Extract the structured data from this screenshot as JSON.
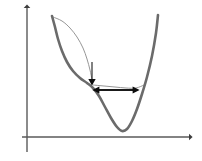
{
  "figure": {
    "background_color": "#ffffff",
    "width": 202,
    "height": 161
  },
  "axes": {
    "x_axis": {
      "label": "",
      "name": "x-axis",
      "color": "#5a5a5a",
      "stroke_width": 1.4,
      "x_start": 22,
      "x_end": 191,
      "y": 137,
      "arrow_at": "right"
    },
    "y_axis": {
      "label": "",
      "name": "y-axis",
      "color": "#5a5a5a",
      "stroke_width": 1.4,
      "x": 27,
      "y_start": 152,
      "y_end": 6,
      "arrow_at": "top"
    }
  },
  "chart_data": {
    "type": "line",
    "title": "",
    "xlabel": "",
    "ylabel": "",
    "grid": false,
    "legend": "none",
    "series": [
      {
        "name": "main-potential-curve",
        "style": "thick",
        "color": "#6b6b6b",
        "stroke_width": 2.6,
        "points": [
          [
            52,
            16
          ],
          [
            55,
            27
          ],
          [
            58,
            39
          ],
          [
            62,
            51
          ],
          [
            67,
            62
          ],
          [
            73,
            71
          ],
          [
            80,
            78
          ],
          [
            87,
            83
          ],
          [
            93,
            88
          ],
          [
            99,
            96
          ],
          [
            105,
            107
          ],
          [
            111,
            118
          ],
          [
            117,
            127
          ],
          [
            122,
            131
          ],
          [
            127,
            129
          ],
          [
            132,
            121
          ],
          [
            137,
            109
          ],
          [
            142,
            94
          ],
          [
            147,
            77
          ],
          [
            152,
            56
          ],
          [
            156,
            33
          ],
          [
            158,
            15
          ]
        ]
      },
      {
        "name": "thin-arc-curve",
        "style": "thin",
        "color": "#8a8a8a",
        "stroke_width": 0.9,
        "points": [
          [
            53,
            17
          ],
          [
            62,
            21
          ],
          [
            70,
            28
          ],
          [
            77,
            37
          ],
          [
            83,
            48
          ],
          [
            87,
            59
          ],
          [
            90,
            70
          ],
          [
            92,
            80
          ],
          [
            92,
            84
          ]
        ]
      },
      {
        "name": "thin-shoulder-arc",
        "style": "thin",
        "color": "#8a8a8a",
        "stroke_width": 0.9,
        "points": [
          [
            93,
            85
          ],
          [
            104,
            86
          ],
          [
            115,
            87
          ],
          [
            126,
            88
          ],
          [
            136,
            88
          ],
          [
            144,
            85
          ]
        ]
      }
    ],
    "annotations": [
      {
        "name": "downward-arrow",
        "type": "arrow",
        "direction": "down",
        "color": "#1a1a1a",
        "stroke_width": 1.1,
        "from": [
          92,
          62
        ],
        "to": [
          92,
          84
        ],
        "head_size": 4.2
      },
      {
        "name": "barrier-width-arrow",
        "type": "double-arrow",
        "direction": "horizontal",
        "color": "#1a1a1a",
        "stroke_width": 2.2,
        "from": [
          95,
          90
        ],
        "to": [
          137,
          90
        ],
        "head_size": 5.0
      }
    ],
    "axis_ranges": {
      "x": [
        22,
        191
      ],
      "y": [
        6,
        152
      ]
    }
  }
}
